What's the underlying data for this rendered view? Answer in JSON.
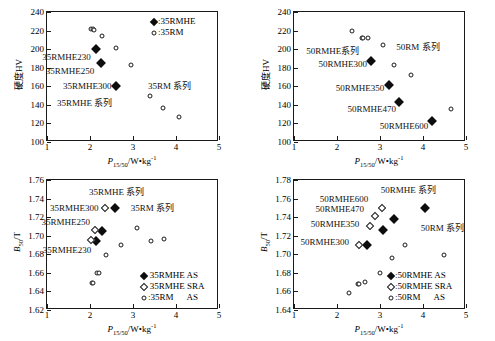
{
  "figure": {
    "panels": [
      {
        "id": "top-left",
        "axis": {
          "xlabel_main": "P",
          "xlabel_sub": "15/50",
          "xlabel_rest": "/W•kg",
          "xlabel_sup": "-1",
          "ylabel": "硬度HV",
          "xlim": [
            1,
            5
          ],
          "ylim": [
            100,
            240
          ],
          "xticks": [
            1,
            2,
            3,
            4,
            5
          ],
          "yticks": [
            100,
            120,
            140,
            160,
            180,
            200,
            220,
            240
          ],
          "xticklabels": [
            "1",
            "2",
            "3",
            "4",
            "5"
          ],
          "yticklabels": [
            "100",
            "120",
            "140",
            "160",
            "180",
            "200",
            "220",
            "240"
          ]
        },
        "annotations": [
          {
            "text": "35RMHE230",
            "x": 2.02,
            "y": 192,
            "align": "r"
          },
          {
            "text": "35RMHE250",
            "x": 2.1,
            "y": 176,
            "align": "r"
          },
          {
            "text": "35RMHE300",
            "x": 2.5,
            "y": 160,
            "align": "r"
          },
          {
            "text": "35RMHE 系列",
            "x": 2.52,
            "y": 142,
            "align": "r"
          },
          {
            "text": "35RM 系列",
            "x": 3.35,
            "y": 160,
            "align": "l"
          }
        ],
        "legend": {
          "position": "top-right",
          "items": [
            {
              "marker": "filled-diamond",
              "label": ":35RMHE"
            },
            {
              "marker": "open-circle",
              "label": ":35RM"
            }
          ]
        },
        "chart_data": {
          "type": "scatter",
          "title": "",
          "xlabel": "P15/50/W•kg-1",
          "ylabel": "硬度HV",
          "xlim": [
            1,
            5
          ],
          "ylim": [
            100,
            240
          ],
          "grid": false,
          "legend_position": "top-right",
          "series": [
            {
              "name": "35RMHE",
              "marker": "filled-diamond",
              "points": [
                {
                  "x": 2.13,
                  "y": 200.5
                },
                {
                  "x": 2.26,
                  "y": 185.0
                },
                {
                  "x": 2.6,
                  "y": 160.5
                }
              ]
            },
            {
              "name": "35RM",
              "marker": "open-circle",
              "points": [
                {
                  "x": 2.03,
                  "y": 222.0
                },
                {
                  "x": 2.08,
                  "y": 222.0
                },
                {
                  "x": 2.1,
                  "y": 221.0
                },
                {
                  "x": 2.28,
                  "y": 214.5
                },
                {
                  "x": 2.6,
                  "y": 201.0
                },
                {
                  "x": 2.95,
                  "y": 182.5
                },
                {
                  "x": 3.4,
                  "y": 150.0
                },
                {
                  "x": 3.7,
                  "y": 137.0
                },
                {
                  "x": 4.07,
                  "y": 127.0
                }
              ]
            }
          ]
        }
      },
      {
        "id": "top-right",
        "axis": {
          "xlabel_main": "P",
          "xlabel_sub": "15/50",
          "xlabel_rest": "/W•kg",
          "xlabel_sup": "-1",
          "ylabel": "硬度HV",
          "xlim": [
            1,
            5
          ],
          "ylim": [
            100,
            240
          ],
          "xticks": [
            1,
            2,
            3,
            4,
            5
          ],
          "yticks": [
            100,
            120,
            140,
            160,
            180,
            200,
            220,
            240
          ],
          "xticklabels": [
            "1",
            "2",
            "3",
            "4",
            "5"
          ],
          "yticklabels": [
            "100",
            "120",
            "140",
            "160",
            "180",
            "200",
            "220",
            "240"
          ]
        },
        "annotations": [
          {
            "text": "50RMHE系列",
            "x": 2.52,
            "y": 198,
            "align": "r"
          },
          {
            "text": "50RMHE300",
            "x": 2.7,
            "y": 184,
            "align": "r"
          },
          {
            "text": "50RMHE350",
            "x": 3.1,
            "y": 158,
            "align": "r"
          },
          {
            "text": "50RMHE470",
            "x": 3.37,
            "y": 136,
            "align": "r"
          },
          {
            "text": "50RMHE600",
            "x": 4.12,
            "y": 117,
            "align": "r"
          },
          {
            "text": "50RM 系列",
            "x": 3.38,
            "y": 202,
            "align": "l"
          }
        ],
        "legend": {
          "position": "none",
          "items": []
        },
        "chart_data": {
          "type": "scatter",
          "title": "",
          "xlabel": "P15/50/W•kg-1",
          "ylabel": "硬度HV",
          "xlim": [
            1,
            5
          ],
          "ylim": [
            100,
            240
          ],
          "grid": false,
          "legend_position": "none",
          "series": [
            {
              "name": "50RMHE",
              "marker": "filled-diamond",
              "points": [
                {
                  "x": 2.78,
                  "y": 187.0
                },
                {
                  "x": 3.2,
                  "y": 161.0
                },
                {
                  "x": 3.45,
                  "y": 143.0
                },
                {
                  "x": 4.2,
                  "y": 123.0
                }
              ]
            },
            {
              "name": "50RM",
              "marker": "open-circle",
              "points": [
                {
                  "x": 2.36,
                  "y": 219.5
                },
                {
                  "x": 2.58,
                  "y": 212.5
                },
                {
                  "x": 2.6,
                  "y": 211.5
                },
                {
                  "x": 2.72,
                  "y": 212.5
                },
                {
                  "x": 3.08,
                  "y": 204.0
                },
                {
                  "x": 3.32,
                  "y": 183.0
                },
                {
                  "x": 3.72,
                  "y": 172.0
                },
                {
                  "x": 4.66,
                  "y": 135.5
                }
              ]
            }
          ]
        }
      },
      {
        "id": "bottom-left",
        "axis": {
          "xlabel_main": "P",
          "xlabel_sub": "15/50",
          "xlabel_rest": "/W•kg",
          "xlabel_sup": "-1",
          "ylabel_main": "B",
          "ylabel_sub": "50",
          "ylabel_rest": "/T",
          "xlim": [
            1,
            5
          ],
          "ylim": [
            1.62,
            1.76
          ],
          "xticks": [
            1,
            2,
            3,
            4,
            5
          ],
          "yticks": [
            1.62,
            1.64,
            1.66,
            1.68,
            1.7,
            1.72,
            1.74,
            1.76
          ],
          "xticklabels": [
            "1",
            "2",
            "3",
            "4",
            "5"
          ],
          "yticklabels": [
            "1.62",
            "1.64",
            "1.66",
            "1.68",
            "1.70",
            "1.72",
            "1.74",
            "1.76"
          ]
        },
        "annotations": [
          {
            "text": "35RMHE 系列",
            "x": 2.62,
            "y": 1.7475,
            "align": "c"
          },
          {
            "text": "35RMHE300",
            "x": 2.2,
            "y": 1.7295,
            "align": "r"
          },
          {
            "text": "35RMHE250",
            "x": 2.0,
            "y": 1.7145,
            "align": "r"
          },
          {
            "text": "35RMHE230",
            "x": 2.03,
            "y": 1.6845,
            "align": "r"
          },
          {
            "text": "35RM 系列",
            "x": 3.45,
            "y": 1.7295,
            "align": "c"
          }
        ],
        "legend": {
          "position": "bottom-right",
          "items": [
            {
              "marker": "filled-diamond",
              "label": " 35RMHE AS"
            },
            {
              "marker": "open-diamond",
              "label": " 35RMHE SRA"
            },
            {
              "marker": "open-circle",
              "label": ":35RM      AS"
            }
          ]
        },
        "chart_data": {
          "type": "scatter",
          "title": "",
          "xlabel": "P15/50/W•kg-1",
          "ylabel": "B50/T",
          "xlim": [
            1,
            5
          ],
          "ylim": [
            1.62,
            1.76
          ],
          "grid": false,
          "legend_position": "bottom-right",
          "series": [
            {
              "name": "35RMHE AS",
              "marker": "filled-diamond",
              "points": [
                {
                  "x": 2.58,
                  "y": 1.7295
                },
                {
                  "x": 2.28,
                  "y": 1.7055
                },
                {
                  "x": 2.15,
                  "y": 1.6945
                }
              ]
            },
            {
              "name": "35RMHE SRA",
              "marker": "open-diamond",
              "points": [
                {
                  "x": 2.35,
                  "y": 1.7295
                },
                {
                  "x": 2.12,
                  "y": 1.7065
                },
                {
                  "x": 2.03,
                  "y": 1.6955
                }
              ]
            },
            {
              "name": "35RM AS",
              "marker": "open-circle",
              "points": [
                {
                  "x": 2.05,
                  "y": 1.6495
                },
                {
                  "x": 2.08,
                  "y": 1.6495
                },
                {
                  "x": 2.16,
                  "y": 1.6595
                },
                {
                  "x": 2.2,
                  "y": 1.6595
                },
                {
                  "x": 2.38,
                  "y": 1.6795
                },
                {
                  "x": 2.72,
                  "y": 1.6895
                },
                {
                  "x": 3.09,
                  "y": 1.7085
                },
                {
                  "x": 3.42,
                  "y": 1.6945
                },
                {
                  "x": 3.72,
                  "y": 1.6965
                }
              ]
            }
          ]
        }
      },
      {
        "id": "bottom-right",
        "axis": {
          "xlabel_main": "P",
          "xlabel_sub": "15/50",
          "xlabel_rest": "/W•kg",
          "xlabel_sup": "-1",
          "ylabel_main": "B",
          "ylabel_sub": "50",
          "ylabel_rest": "/T",
          "xlim": [
            1,
            5
          ],
          "ylim": [
            1.64,
            1.78
          ],
          "xticks": [
            1,
            2,
            3,
            4,
            5
          ],
          "yticks": [
            1.64,
            1.66,
            1.68,
            1.7,
            1.72,
            1.74,
            1.76,
            1.78
          ],
          "xticklabels": [
            "1",
            "2",
            "3",
            "4",
            "5"
          ],
          "yticklabels": [
            "1.64",
            "1.66",
            "1.68",
            "1.70",
            "1.72",
            "1.74",
            "1.76",
            "1.78"
          ]
        },
        "annotations": [
          {
            "text": "50RMHE 系列",
            "x": 4.3,
            "y": 1.7695,
            "align": "r"
          },
          {
            "text": "50RMHE600",
            "x": 2.73,
            "y": 1.7595,
            "align": "r"
          },
          {
            "text": "50RMHE470",
            "x": 2.63,
            "y": 1.7485,
            "align": "r"
          },
          {
            "text": "50RMHE350",
            "x": 2.52,
            "y": 1.7325,
            "align": "r"
          },
          {
            "text": "50RMHE300",
            "x": 2.28,
            "y": 1.7135,
            "align": "r"
          },
          {
            "text": "50RM 系列",
            "x": 3.95,
            "y": 1.7285,
            "align": "l"
          }
        ],
        "legend": {
          "position": "bottom-right",
          "items": [
            {
              "marker": "filled-diamond",
              "label": ":50RMHE AS"
            },
            {
              "marker": "open-diamond",
              "label": ":50RMHE SRA"
            },
            {
              "marker": "open-circle",
              "label": ":50RM      AS"
            }
          ]
        },
        "chart_data": {
          "type": "scatter",
          "title": "",
          "xlabel": "P15/50/W•kg-1",
          "ylabel": "B50/T",
          "xlim": [
            1,
            5
          ],
          "ylim": [
            1.64,
            1.78
          ],
          "grid": false,
          "legend_position": "bottom-right",
          "series": [
            {
              "name": "50RMHE AS",
              "marker": "filled-diamond",
              "points": [
                {
                  "x": 4.04,
                  "y": 1.7495
                },
                {
                  "x": 3.32,
                  "y": 1.7385
                },
                {
                  "x": 3.06,
                  "y": 1.7265
                },
                {
                  "x": 2.69,
                  "y": 1.7095
                }
              ]
            },
            {
              "name": "50RMHE SRA",
              "marker": "open-diamond",
              "points": [
                {
                  "x": 3.04,
                  "y": 1.7495
                },
                {
                  "x": 2.88,
                  "y": 1.7415
                },
                {
                  "x": 2.77,
                  "y": 1.7305
                },
                {
                  "x": 2.52,
                  "y": 1.7105
                }
              ]
            },
            {
              "name": "50RM AS",
              "marker": "open-circle",
              "points": [
                {
                  "x": 2.29,
                  "y": 1.6585
                },
                {
                  "x": 2.48,
                  "y": 1.6685
                },
                {
                  "x": 2.52,
                  "y": 1.6685
                },
                {
                  "x": 2.66,
                  "y": 1.6705
                },
                {
                  "x": 2.99,
                  "y": 1.6795
                },
                {
                  "x": 3.28,
                  "y": 1.6955
                },
                {
                  "x": 3.59,
                  "y": 1.7105
                },
                {
                  "x": 4.48,
                  "y": 1.6995
                }
              ]
            }
          ]
        }
      }
    ]
  }
}
